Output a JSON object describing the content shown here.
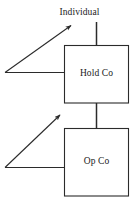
{
  "diagram": {
    "canvas": {
      "width": 137,
      "height": 208,
      "background": "#ffffff"
    },
    "stroke_color": "#2b2b2b",
    "text_color": "#1a1a1a",
    "nodes": [
      {
        "id": "individual",
        "label": "Individual",
        "type": "text-label",
        "x": 96,
        "y": 15
      },
      {
        "id": "holdco",
        "label": "Hold Co",
        "type": "box",
        "x": 64,
        "y": 45,
        "width": 65,
        "height": 58
      },
      {
        "id": "opco",
        "label": "Op Co",
        "type": "box",
        "x": 64,
        "y": 128,
        "width": 65,
        "height": 68
      }
    ],
    "edges": [
      {
        "id": "individual-to-holdco",
        "type": "line",
        "from": "individual",
        "to": "holdco",
        "points": "96,22 96,45"
      },
      {
        "id": "holdco-to-opco",
        "type": "line",
        "from": "holdco",
        "to": "opco",
        "points": "96,103 96,128"
      },
      {
        "id": "holdco-left-stem",
        "type": "line",
        "from": "holdco",
        "to": "upper-corner",
        "points": "64,72 5,72"
      },
      {
        "id": "upper-arrow-to-individual",
        "type": "arrow",
        "from": "upper-corner",
        "to": "individual",
        "points": "5,72 74,23"
      },
      {
        "id": "opco-left-stem",
        "type": "line",
        "from": "opco",
        "to": "lower-corner",
        "points": "64,167 5,167"
      },
      {
        "id": "lower-arrow-to-holdco",
        "type": "arrow",
        "from": "lower-corner",
        "to": "holdco",
        "points": "5,167 63,112"
      }
    ]
  }
}
